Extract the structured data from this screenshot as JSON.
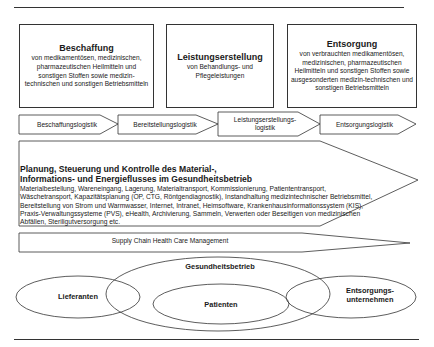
{
  "top_boxes": [
    {
      "title": "Beschaffung",
      "description": "von  medikamentösen, medizinischen, pharmazeutischen Heilmitteln und sonstigen Stoffen sowie medizin-technischen und sonstigen Betriebsmitteln"
    },
    {
      "title": "Leistungserstellung",
      "description": "von Behandlungs- und Pflegeleistungen"
    },
    {
      "title": "Entsorgung",
      "description": "von verbrauchten medikamentösen, medizinischen, pharmazeutischen Heilmitteln und sonstigen Stoffen sowie ausgesonderten medizin-technischen und sonstigen Betriebsmitteln"
    }
  ],
  "logistics_chain": [
    {
      "label": "Beschaffungslogistik"
    },
    {
      "label": "Bereitstellungslogistik"
    },
    {
      "label": "Leistungserstellungs-logistik"
    },
    {
      "label": "Entsorgungslogistik"
    }
  ],
  "planning": {
    "title_line1": "Planung, Steuerung und Kontrolle des Material-,",
    "title_line2": "Informations- und Energieflusses im Gesundheitsbetrieb",
    "text": "Materialbestellung, Wareneingang, Lagerung, Materialtransport, Kommissionierung, Patiententransport, Wäschetransport, Kapazitätsplanung (OP, CTG, Röntgendiagnostik), Instandhaltung medizintechnischer Betriebsmittel, Bereitstellung von Strom und Warmwasser, Internet, Intranet, Heimsoftware, Krankenhausinformationssystem (KIS), Praxis-Verwaltungssysteme (PVS), eHealth, Archivierung, Sammeln, Verwerten oder Beseitigen von medizinischen Abfällen, Steriligutversorgung etc."
  },
  "scm": {
    "label": "Supply Chain Health Care Management"
  },
  "ellipses": {
    "suppliers": "Lieferanten",
    "health_facility": "Gesundheitsbetrieb",
    "patients": "Patienten",
    "disposal_line1": "Entsorgungs-",
    "disposal_line2": "unternehmen"
  },
  "colors": {
    "stroke": "#333333",
    "text": "#1a1a1a",
    "background": "#ffffff"
  }
}
